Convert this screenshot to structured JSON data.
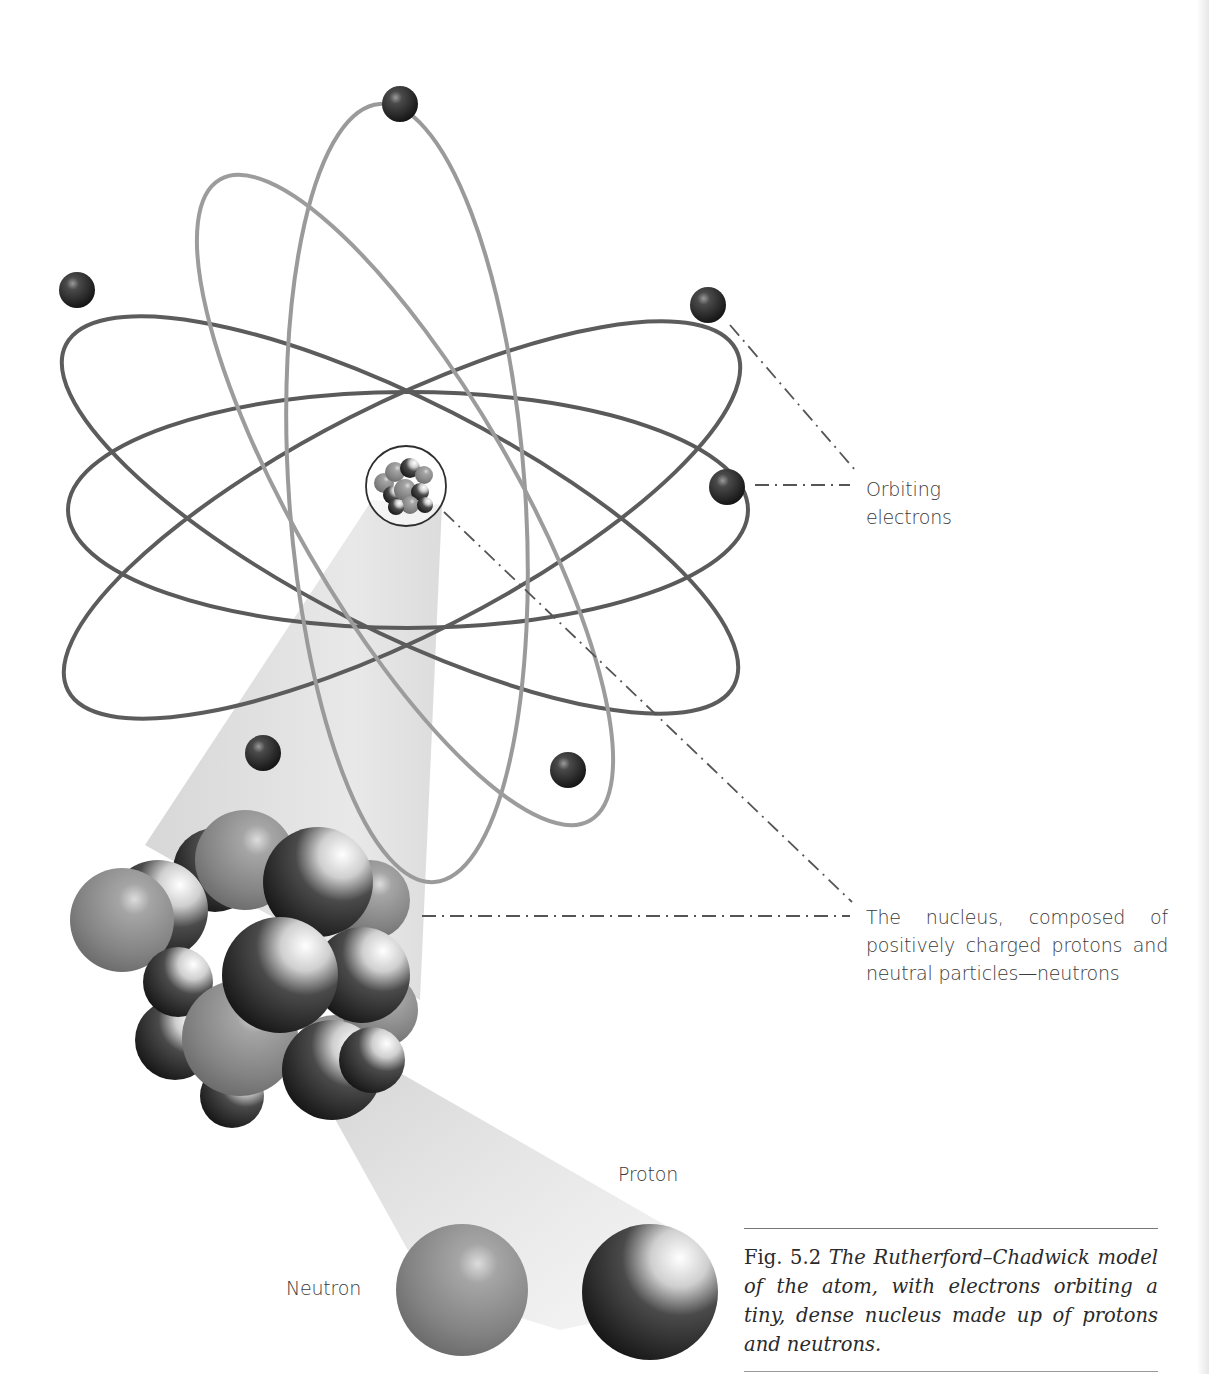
{
  "figure": {
    "title": "Rutherford–Chadwick model of the atom",
    "labels": {
      "orbiting_electrons_line1": "Orbiting",
      "orbiting_electrons_line2": "electrons",
      "nucleus": "The nucleus, composed of positively charged protons and neutral particles—neutrons",
      "proton": "Proton",
      "neutron": "Neutron"
    },
    "caption": {
      "fig_number": "Fig. 5.2",
      "text": "The Rutherford–Chadwick model of the atom, with electrons orbiting a tiny, dense nucleus made up of protons and neutrons."
    },
    "elements": {
      "electron_count": 7,
      "orbit_count": 5,
      "components": [
        "electron",
        "orbit",
        "nucleus",
        "proton",
        "neutron"
      ]
    },
    "colors": {
      "orbit_dark": "#5a5a5a",
      "orbit_light": "#9a9a9a",
      "electron": "#2b2b2b",
      "neutron": "#8c8c8c",
      "proton_dark": "#1e1e1e",
      "proton_light": "#f2f2f2",
      "projection_beam": "#d8d8d8",
      "leader_line": "#555555",
      "text": "#3a3a3a"
    }
  }
}
